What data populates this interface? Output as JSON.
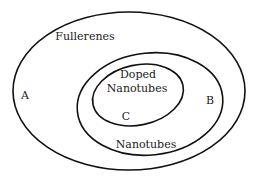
{
  "diagram": {
    "type": "venn-nested",
    "sets": [
      {
        "id": "outer",
        "label": "Fullerenes",
        "region_letter": "A"
      },
      {
        "id": "middle",
        "label": "Nanotubes",
        "region_letter": "B"
      },
      {
        "id": "inner",
        "label_line1": "Doped",
        "label_line2": "Nanotubes",
        "region_letter": "C"
      }
    ],
    "colors": {
      "stroke": "#111111",
      "text": "#1a1a1a",
      "background": "#ffffff"
    }
  }
}
